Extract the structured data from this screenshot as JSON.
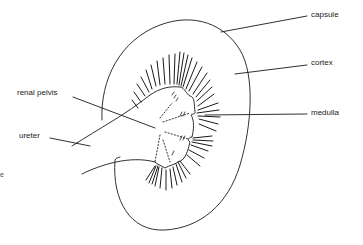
{
  "diagram": {
    "labels": {
      "capsule": "capsule",
      "cortex": "cortex",
      "medulla": "medulla",
      "renal_pelvis": "renal pelvis",
      "ureter": "ureter",
      "edge_fragment": "e"
    },
    "colors": {
      "ink": "#1a1a1a",
      "background": "#ffffff"
    }
  }
}
